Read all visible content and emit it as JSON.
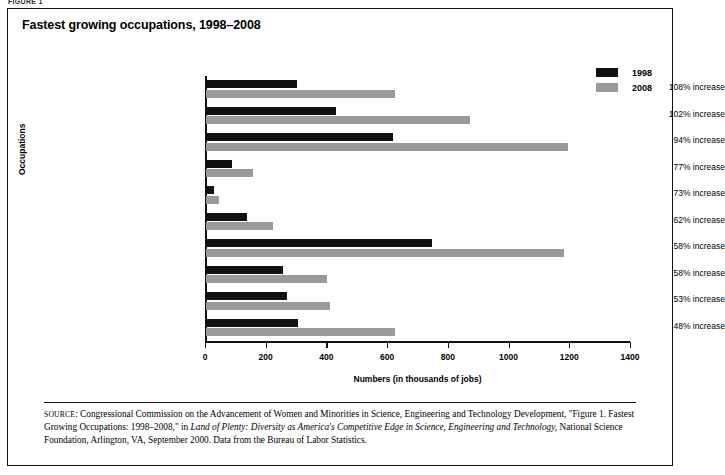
{
  "figure_caption": "FIGURE 1",
  "title": "Fastest growing occupations, 1998–2008",
  "legend": {
    "items": [
      {
        "label": "1998",
        "color": "#111111"
      },
      {
        "label": "2008",
        "color": "#9a9a9a"
      }
    ]
  },
  "axes": {
    "x_title": "Numbers (in thousands of jobs)",
    "y_title": "Occupations",
    "x_ticks": [
      "0",
      "200",
      "400",
      "600",
      "800",
      "1000",
      "1200",
      "1400"
    ]
  },
  "source": {
    "prefix": "SOURCE",
    "line1": ": Congressional Commission on the Advancement of Women and Minorities in Science, Engineering and Technology Development, \"Figure 1.",
    "line2a": "Fastest Growing Occupations: 1998–2008,\" in ",
    "line2b": "Land of Plenty: Diversity as America's Competitive Edge in Science, Engineering and Technology,",
    "line3": "National Science Foundation, Arlington, VA, September 2000. Data from the Bureau of Labor Statistics."
  },
  "chart_data": {
    "type": "bar",
    "orientation": "horizontal",
    "title": "Fastest growing occupations, 1998–2008",
    "xlabel": "Numbers (in thousands of jobs)",
    "ylabel": "Occupations",
    "xlim": [
      0,
      1400
    ],
    "xticks": [
      0,
      200,
      400,
      600,
      800,
      1000,
      1200,
      1400
    ],
    "grid": false,
    "legend_position": "top-right",
    "categories": [
      "Computer engineers",
      "Computer support specialists",
      "Systems analysts",
      "Database administrators",
      "Desktop publishing specialists",
      "Paralegals and legal assistants",
      "Personal care and home health aides",
      "Medical assistants",
      "Social and human service assistants",
      "Physician assistants"
    ],
    "series": [
      {
        "name": "1998",
        "color": "#111111",
        "values": [
          299,
          429,
          617,
          87,
          26,
          136,
          746,
          252,
          268,
          303
        ]
      },
      {
        "name": "2008",
        "color": "#9a9a9a",
        "values": [
          622,
          869,
          1194,
          155,
          44,
          220,
          1179,
          398,
          410,
          622
        ]
      }
    ],
    "annotations": [
      "108% increase",
      "102% increase",
      "94% increase",
      "77% increase",
      "73% increase",
      "62% increase",
      "58% increase",
      "58% increase",
      "53% increase",
      "48% increase"
    ]
  }
}
